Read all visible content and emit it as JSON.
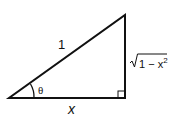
{
  "diagram": {
    "type": "right-triangle",
    "labels": {
      "hypotenuse": "1",
      "angle": "θ",
      "adjacent": "x",
      "opposite_radical": "1 − x",
      "opposite_exponent": "2"
    },
    "colors": {
      "stroke": "#111111",
      "background": "#ffffff"
    }
  }
}
